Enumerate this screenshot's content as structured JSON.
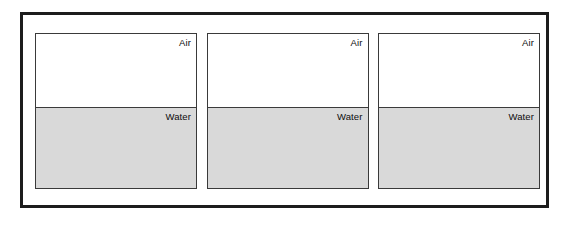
{
  "figure": {
    "name": "air-water-containers",
    "background_color": "#ffffff",
    "outer_frame": {
      "border_color": "#1c1c1c",
      "fill_color": "#ffffff"
    },
    "container_defaults": {
      "border_color": "#3a3a3a",
      "air_fill_color": "#ffffff",
      "water_fill_color": "#d9d9d9"
    },
    "containers": [
      {
        "id": "container-1",
        "layers": [
          {
            "id": "air",
            "label": "Air",
            "fill": "#ffffff"
          },
          {
            "id": "water",
            "label": "Water",
            "fill": "#d9d9d9"
          }
        ]
      },
      {
        "id": "container-2",
        "layers": [
          {
            "id": "air",
            "label": "Air",
            "fill": "#ffffff"
          },
          {
            "id": "water",
            "label": "Water",
            "fill": "#d9d9d9"
          }
        ]
      },
      {
        "id": "container-3",
        "layers": [
          {
            "id": "air",
            "label": "Air",
            "fill": "#ffffff"
          },
          {
            "id": "water",
            "label": "Water",
            "fill": "#d9d9d9"
          }
        ]
      }
    ]
  }
}
